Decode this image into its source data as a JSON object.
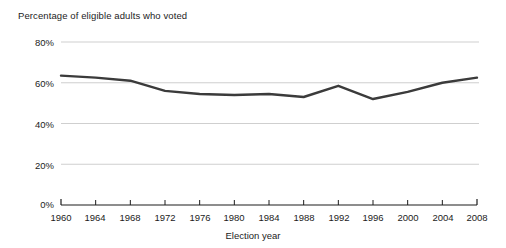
{
  "chart_data": {
    "type": "line",
    "title": "Percentage of eligible adults who voted",
    "xlabel": "Election year",
    "ylabel": "",
    "x": [
      1960,
      1964,
      1968,
      1972,
      1976,
      1980,
      1984,
      1988,
      1992,
      1996,
      2000,
      2004,
      2008
    ],
    "categories": [
      "1960",
      "1964",
      "1968",
      "1972",
      "1976",
      "1980",
      "1984",
      "1988",
      "1992",
      "1996",
      "2000",
      "2004",
      "2008"
    ],
    "values": [
      63.5,
      62.5,
      61.0,
      56.0,
      54.5,
      54.0,
      54.5,
      53.0,
      58.5,
      52.0,
      55.5,
      60.0,
      62.5
    ],
    "series": [
      {
        "name": "Percentage of eligible adults who voted",
        "values": [
          63.5,
          62.5,
          61.0,
          56.0,
          54.5,
          54.0,
          54.5,
          53.0,
          58.5,
          52.0,
          55.5,
          60.0,
          62.5
        ]
      }
    ],
    "ylim": [
      0,
      80
    ],
    "xlim": [
      1960,
      2008
    ],
    "ytick_labels": [
      "0%",
      "20%",
      "40%",
      "60%",
      "80%"
    ],
    "ytick_values": [
      0,
      20,
      40,
      60,
      80
    ],
    "grid": true,
    "grid_axis": "y",
    "legend": "none",
    "line_color": "#3b3b3b",
    "grid_color": "#c9c9c9",
    "axis_color": "#1c1c1c",
    "background": "#ffffff"
  }
}
